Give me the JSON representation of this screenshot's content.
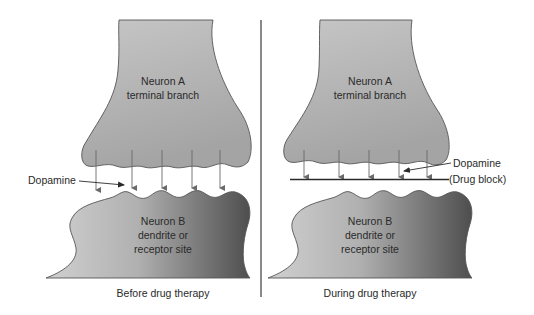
{
  "panels": [
    {
      "id": "before",
      "neuron_a": {
        "line1": "Neuron A",
        "line2": "terminal branch"
      },
      "neuron_b": {
        "line1": "Neuron B",
        "line2": "dendrite or",
        "line3": "receptor site"
      },
      "dopamine_label": "Dopamine",
      "caption": "Before drug therapy"
    },
    {
      "id": "during",
      "neuron_a": {
        "line1": "Neuron A",
        "line2": "terminal branch"
      },
      "neuron_b": {
        "line1": "Neuron B",
        "line2": "dendrite or",
        "line3": "receptor site"
      },
      "dopamine_label": "Dopamine",
      "drug_block_label": "(Drug block)",
      "caption": "During drug therapy"
    }
  ],
  "colors": {
    "neuron_a_fill": "#b9b9b9",
    "neuron_b_light": "#d2d2d2",
    "neuron_b_dark": "#5a5a5a",
    "outline": "#555555",
    "arrow": "#6a6a6a",
    "divider": "#3a3a3a"
  }
}
